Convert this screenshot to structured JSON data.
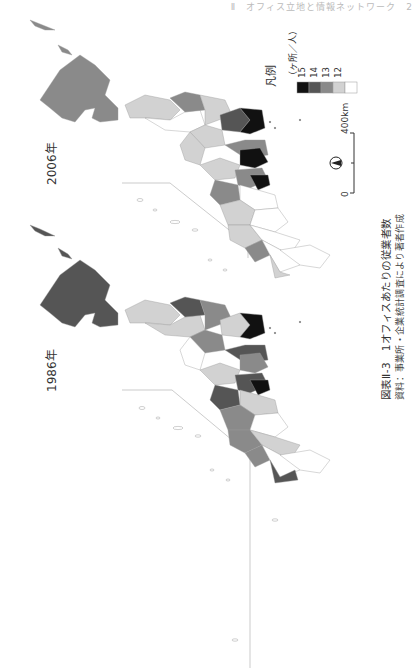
{
  "page": {
    "running_header": "Ⅱ　オフィス立地と情報ネットワーク　2"
  },
  "maps": [
    {
      "year_label": "1986年",
      "hokkaido_class": 14
    },
    {
      "year_label": "2006年",
      "hokkaido_class": 13
    }
  ],
  "legend": {
    "title": "凡例",
    "unit": "（ヶ所／人）",
    "classes": [
      {
        "label": "15",
        "color": "#111111"
      },
      {
        "label": "14",
        "color": "#555555"
      },
      {
        "label": "13",
        "color": "#8a8a8a"
      },
      {
        "label": "12",
        "color": "#d2d2d2"
      },
      {
        "label": "",
        "color": "#ffffff"
      }
    ]
  },
  "scale_bar": {
    "start_label": "0",
    "end_label": "400km"
  },
  "north_arrow": {
    "icon": "north-arrow-icon"
  },
  "caption": {
    "title": "図表Ⅱ-3　1オフィスあたりの従業者数",
    "source": "資料：事業所・企業統計調査により著者作成"
  }
}
